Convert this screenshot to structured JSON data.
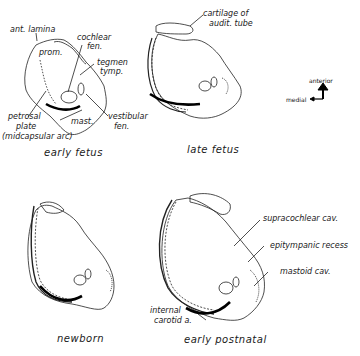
{
  "figure": {
    "panels": [
      {
        "id": "early-fetus",
        "caption": "early fetus",
        "labels": {
          "ant_lamina": "ant. lamina",
          "prom": "prom.",
          "cochlear_fen_1": "cochlear",
          "cochlear_fen_2": "fen.",
          "tegmen_tymp_1": "tegmen",
          "tegmen_tymp_2": "tymp.",
          "petrosal_plate_1": "petrosal",
          "petrosal_plate_2": "plate",
          "petrosal_plate_3": "(midcapsular arc)",
          "mast": "mast.",
          "vestibular_fen_1": "vestibular",
          "vestibular_fen_2": "fen."
        }
      },
      {
        "id": "late-fetus",
        "caption": "late fetus",
        "labels": {
          "cartilage_1": "cartilage of",
          "cartilage_2": "audit. tube"
        }
      },
      {
        "id": "newborn",
        "caption": "newborn",
        "labels": {}
      },
      {
        "id": "early-postnatal",
        "caption": "early postnatal",
        "labels": {
          "supracochlear": "supracochlear cav.",
          "epitympanic": "epitympanic recess",
          "mastoid": "mastoid cav.",
          "carotid_1": "internal",
          "carotid_2": "carotid a."
        }
      }
    ],
    "orientation": {
      "anterior": "anterior",
      "medial": "medial"
    }
  }
}
